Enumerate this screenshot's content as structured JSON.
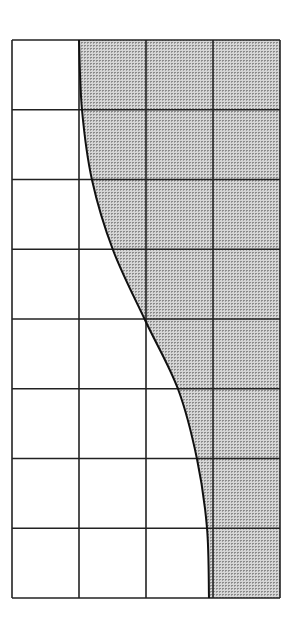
{
  "diagram": {
    "type": "grid-with-shaded-curve-region",
    "grid": {
      "columns": 4,
      "rows": 8,
      "left": 12,
      "top": 40,
      "right": 280,
      "bottom": 598,
      "line_color": "#222222",
      "shaded_column_dividers": "dotted"
    },
    "curve": {
      "description": "S-shaped boundary from top of 2nd column line to bottom of 4th column line, passing through grid center",
      "points": [
        [
          79,
          40
        ],
        [
          82,
          110
        ],
        [
          92,
          180
        ],
        [
          113,
          250
        ],
        [
          145,
          320
        ],
        [
          178,
          389
        ],
        [
          197,
          459
        ],
        [
          207,
          528
        ],
        [
          209,
          598
        ]
      ]
    },
    "shading": {
      "region": "right of curve",
      "fill": "#c8c8c8",
      "dot_color": "#8a8a8a",
      "pattern": "fine-dots"
    }
  }
}
